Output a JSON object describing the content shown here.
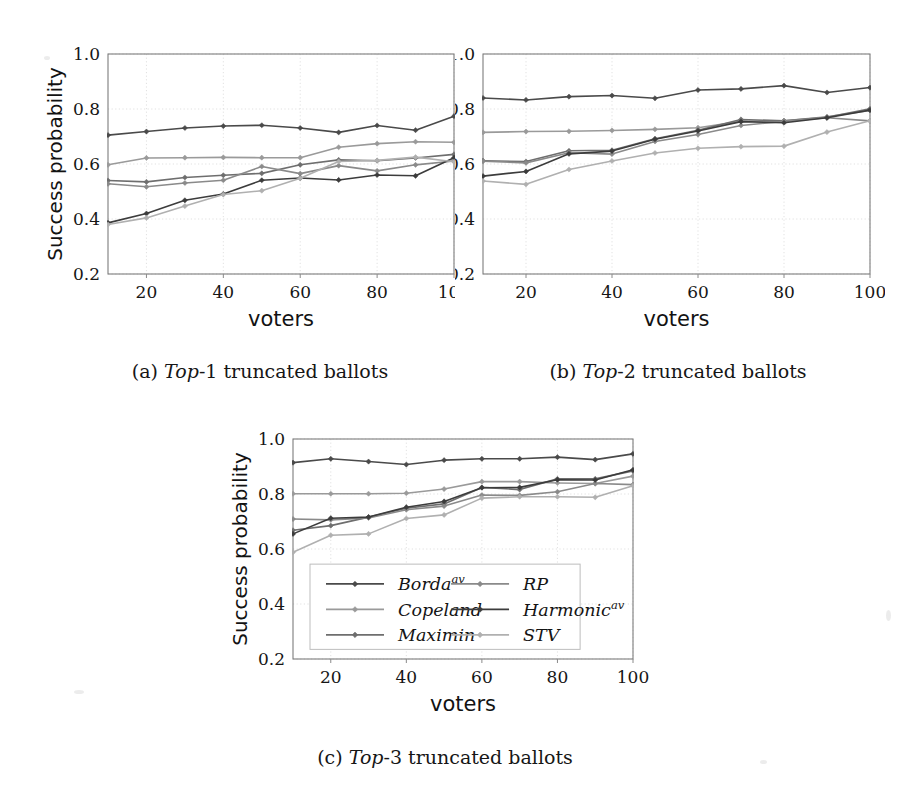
{
  "figure": {
    "background_color": "#ffffff",
    "ink_color": "#141414"
  },
  "axes": {
    "xlabel": "voters",
    "ylabel": "Success probability",
    "xticks": [
      20,
      40,
      60,
      80,
      100
    ],
    "xtick_labels": [
      "20",
      "40",
      "60",
      "80",
      "100"
    ],
    "yticks": [
      0.2,
      0.4,
      0.6,
      0.8,
      1.0
    ],
    "ytick_labels": [
      "0.2",
      "0.4",
      "0.6",
      "0.8",
      "1.0"
    ],
    "xlim": [
      10,
      100
    ],
    "ylim": [
      0.2,
      1.0
    ],
    "grid": true
  },
  "legend": {
    "position": "inside-lower-center-of-panel-c",
    "entries": [
      {
        "label": "Borda",
        "sup": "av",
        "color": "#4a4a4a",
        "marker": "diamond"
      },
      {
        "label": "Copeland",
        "sup": "",
        "color": "#9a9a9a",
        "marker": "diamond"
      },
      {
        "label": "Maximin",
        "sup": "",
        "color": "#6e6e6e",
        "marker": "diamond"
      },
      {
        "label": "RP",
        "sup": "",
        "color": "#8a8a8a",
        "marker": "diamond"
      },
      {
        "label": "Harmonic",
        "sup": "av",
        "color": "#3c3c3c",
        "marker": "diamond"
      },
      {
        "label": "STV",
        "sup": "",
        "color": "#b0b0b0",
        "marker": "diamond"
      }
    ]
  },
  "captions": {
    "a": {
      "prefix": "(a) ",
      "italic": "Top",
      "suffix": "-1 truncated ballots"
    },
    "b": {
      "prefix": "(b) ",
      "italic": "Top",
      "suffix": "-2 truncated ballots"
    },
    "c": {
      "prefix": "(c) ",
      "italic": "Top",
      "suffix": "-3 truncated ballots"
    }
  },
  "chart_data": [
    {
      "id": "a",
      "type": "line",
      "title": "(a) Top-1 truncated ballots",
      "xlabel": "voters",
      "ylabel": "Success probability",
      "xlim": [
        10,
        100
      ],
      "ylim": [
        0.2,
        1.0
      ],
      "grid": true,
      "x": [
        10,
        20,
        30,
        40,
        50,
        60,
        70,
        80,
        90,
        100
      ],
      "series": [
        {
          "name": "Borda^av",
          "color": "#4a4a4a",
          "values": [
            0.705,
            0.718,
            0.731,
            0.738,
            0.741,
            0.731,
            0.715,
            0.74,
            0.723,
            0.774
          ]
        },
        {
          "name": "Copeland",
          "color": "#9a9a9a",
          "values": [
            0.597,
            0.622,
            0.623,
            0.624,
            0.623,
            0.623,
            0.661,
            0.674,
            0.681,
            0.679
          ]
        },
        {
          "name": "Maximin",
          "color": "#6e6e6e",
          "values": [
            0.54,
            0.535,
            0.551,
            0.559,
            0.566,
            0.597,
            0.615,
            0.612,
            0.622,
            0.635
          ]
        },
        {
          "name": "RP",
          "color": "#8a8a8a",
          "values": [
            0.528,
            0.517,
            0.531,
            0.541,
            0.591,
            0.565,
            0.594,
            0.575,
            0.597,
            0.611
          ]
        },
        {
          "name": "Harmonic^av",
          "color": "#3c3c3c",
          "values": [
            0.386,
            0.42,
            0.468,
            0.491,
            0.541,
            0.549,
            0.542,
            0.56,
            0.557,
            0.623
          ]
        },
        {
          "name": "STV",
          "color": "#b0b0b0",
          "values": [
            0.38,
            0.404,
            0.447,
            0.489,
            0.503,
            0.548,
            0.609,
            0.613,
            0.625,
            0.608
          ]
        }
      ]
    },
    {
      "id": "b",
      "type": "line",
      "title": "(b) Top-2 truncated ballots",
      "xlabel": "voters",
      "ylabel": "Success probability",
      "xlim": [
        10,
        100
      ],
      "ylim": [
        0.2,
        1.0
      ],
      "grid": true,
      "x": [
        10,
        20,
        30,
        40,
        50,
        60,
        70,
        80,
        90,
        100
      ],
      "series": [
        {
          "name": "Borda^av",
          "color": "#4a4a4a",
          "values": [
            0.84,
            0.833,
            0.845,
            0.849,
            0.839,
            0.869,
            0.873,
            0.885,
            0.86,
            0.878
          ]
        },
        {
          "name": "Copeland",
          "color": "#9a9a9a",
          "values": [
            0.715,
            0.718,
            0.719,
            0.722,
            0.726,
            0.732,
            0.755,
            0.757,
            0.772,
            0.795
          ]
        },
        {
          "name": "Maximin",
          "color": "#6e6e6e",
          "values": [
            0.612,
            0.609,
            0.648,
            0.65,
            0.692,
            0.723,
            0.762,
            0.757,
            0.77,
            0.801
          ]
        },
        {
          "name": "RP",
          "color": "#8a8a8a",
          "values": [
            0.61,
            0.604,
            0.641,
            0.636,
            0.682,
            0.707,
            0.74,
            0.755,
            0.768,
            0.757
          ]
        },
        {
          "name": "Harmonic^av",
          "color": "#3c3c3c",
          "values": [
            0.556,
            0.573,
            0.637,
            0.647,
            0.69,
            0.72,
            0.754,
            0.75,
            0.768,
            0.796
          ]
        },
        {
          "name": "STV",
          "color": "#b0b0b0",
          "values": [
            0.538,
            0.526,
            0.58,
            0.611,
            0.64,
            0.657,
            0.663,
            0.665,
            0.716,
            0.757
          ]
        }
      ]
    },
    {
      "id": "c",
      "type": "line",
      "title": "(c) Top-3 truncated ballots",
      "xlabel": "voters",
      "ylabel": "Success probability",
      "xlim": [
        10,
        100
      ],
      "ylim": [
        0.2,
        1.0
      ],
      "grid": true,
      "x": [
        10,
        20,
        30,
        40,
        50,
        60,
        70,
        80,
        90,
        100
      ],
      "series": [
        {
          "name": "Borda^av",
          "color": "#4a4a4a",
          "values": [
            0.914,
            0.928,
            0.918,
            0.907,
            0.923,
            0.928,
            0.928,
            0.934,
            0.925,
            0.946
          ]
        },
        {
          "name": "Copeland",
          "color": "#9a9a9a",
          "values": [
            0.801,
            0.801,
            0.801,
            0.803,
            0.818,
            0.845,
            0.845,
            0.84,
            0.838,
            0.865
          ]
        },
        {
          "name": "Maximin",
          "color": "#6e6e6e",
          "values": [
            0.668,
            0.685,
            0.716,
            0.748,
            0.764,
            0.824,
            0.816,
            0.855,
            0.855,
            0.884
          ]
        },
        {
          "name": "RP",
          "color": "#8a8a8a",
          "values": [
            0.709,
            0.706,
            0.713,
            0.743,
            0.756,
            0.796,
            0.795,
            0.808,
            0.838,
            0.834
          ]
        },
        {
          "name": "Harmonic^av",
          "color": "#3c3c3c",
          "values": [
            0.655,
            0.712,
            0.716,
            0.752,
            0.773,
            0.823,
            0.824,
            0.852,
            0.851,
            0.888
          ]
        },
        {
          "name": "STV",
          "color": "#b0b0b0",
          "values": [
            0.588,
            0.65,
            0.655,
            0.711,
            0.724,
            0.785,
            0.79,
            0.79,
            0.788,
            0.83
          ]
        }
      ]
    }
  ]
}
